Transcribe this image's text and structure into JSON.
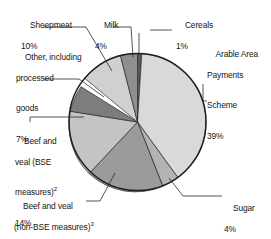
{
  "chart_data": {
    "type": "pie",
    "title": "",
    "unit": "%",
    "start_angle_deg": 0,
    "direction": "clockwise",
    "legend": "callout-labels",
    "grid": false,
    "categories": [
      "Cereals",
      "Arable Area Payments Scheme",
      "Sugar",
      "Beef and veal (non-BSE measures)",
      "Beef and veal (BSE measures)",
      "Other, including processed goods",
      "Sheepmeat",
      "Milk"
    ],
    "values": [
      1,
      39,
      4,
      21,
      14,
      7,
      10,
      4
    ],
    "colors": [
      "#5a5a5a",
      "#d9d9d9",
      "#b3b3b3",
      "#9b9b9b",
      "#c4c4c4",
      "#7d7d7d",
      "#d0d0d0",
      "#8f8f8f"
    ],
    "slices": [
      {
        "name": "cereals",
        "label": "Cereals",
        "value": 1,
        "pct_text": "1%",
        "color": "#5a5a5a",
        "footnote": ""
      },
      {
        "name": "arable",
        "label": "Arable Area Payments Scheme",
        "value": 39,
        "pct_text": "39%",
        "color": "#d9d9d9",
        "footnote": ""
      },
      {
        "name": "sugar",
        "label": "Sugar",
        "value": 4,
        "pct_text": "4%",
        "color": "#b3b3b3",
        "footnote": ""
      },
      {
        "name": "beef-nonbse",
        "label": "Beef and veal (non-BSE measures)",
        "value": 21,
        "pct_text": "21%",
        "color": "#9b9b9b",
        "footnote": "3"
      },
      {
        "name": "beef-bse",
        "label": "Beef and veal (BSE measures)",
        "value": 14,
        "pct_text": "14%",
        "color": "#c4c4c4",
        "footnote": "2"
      },
      {
        "name": "other",
        "label": "Other, including processed goods",
        "value": 7,
        "pct_text": "7%",
        "color": "#7d7d7d",
        "footnote": ""
      },
      {
        "name": "sheepmeat",
        "label": "Sheepmeat",
        "value": 10,
        "pct_text": "10%",
        "color": "#d0d0d0",
        "footnote": ""
      },
      {
        "name": "milk",
        "label": "Milk",
        "value": 4,
        "pct_text": "4%",
        "color": "#8f8f8f",
        "footnote": ""
      }
    ]
  },
  "labels": {
    "sheepmeat": {
      "line1": "Sheepmeat",
      "pct": "10%"
    },
    "milk": {
      "line1": "Milk",
      "pct": "4%"
    },
    "cereals": {
      "line1": "Cereals",
      "pct": "1%"
    },
    "arable": {
      "line1": "Arable Area",
      "line2": "Payments",
      "line3": "Scheme",
      "pct": "39%"
    },
    "other": {
      "line1": "Other, including",
      "line2": "processed",
      "line3": "goods",
      "pct": "7%"
    },
    "beef_bse": {
      "line1": "Beef and",
      "line2": "veal (BSE",
      "line3": "measures)",
      "sup": "2",
      "pct": "14%"
    },
    "beef_nonbse": {
      "line1": "Beef and veal",
      "line2": "(non-BSE measures)",
      "sup": "3",
      "pct": "21%"
    },
    "sugar": {
      "line1": "Sugar",
      "pct": "4%"
    }
  }
}
